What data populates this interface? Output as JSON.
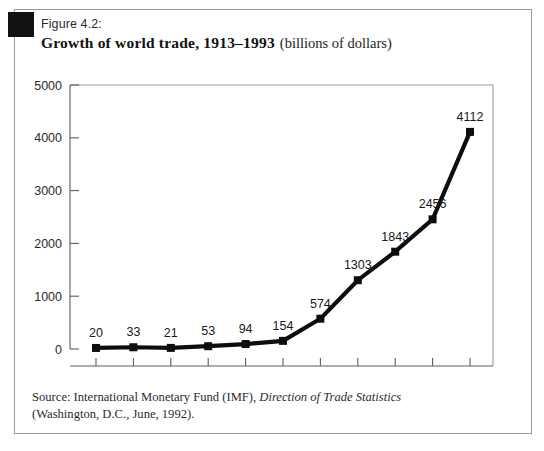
{
  "figure": {
    "number_label": "Figure 4.2:",
    "title_bold": "Growth of world trade, 1913–1993",
    "title_regular": "(billions of dollars)",
    "corner_mark_name": "black-square-mark"
  },
  "source": {
    "line1_prefix": "Source: International Monetary Fund (IMF), ",
    "line1_italic": "Direction of Trade Statistics",
    "line2": "(Washington, D.C., June, 1992)."
  },
  "chart_data": {
    "type": "line",
    "xlabel": "",
    "ylabel": "",
    "categories": [
      "1913",
      "1928",
      "1933",
      "1948",
      "1958",
      "1963",
      "1973",
      "1978",
      "1982",
      "1987",
      "1993"
    ],
    "values": [
      20,
      33,
      21,
      53,
      94,
      154,
      574,
      1303,
      1843,
      2456,
      4112
    ],
    "point_labels": [
      "20",
      "33",
      "21",
      "53",
      "94",
      "154",
      "574",
      "1303",
      "1843",
      "2456",
      "4112"
    ],
    "ylim": [
      0,
      5000
    ],
    "yticks": [
      0,
      1000,
      2000,
      3000,
      4000,
      5000
    ],
    "ytick_labels": [
      "0",
      "1000",
      "2000",
      "3000",
      "4000",
      "5000"
    ],
    "grid": false,
    "legend": false,
    "series_color": "#0d0d0d",
    "marker": "square",
    "units": "billions of dollars"
  }
}
